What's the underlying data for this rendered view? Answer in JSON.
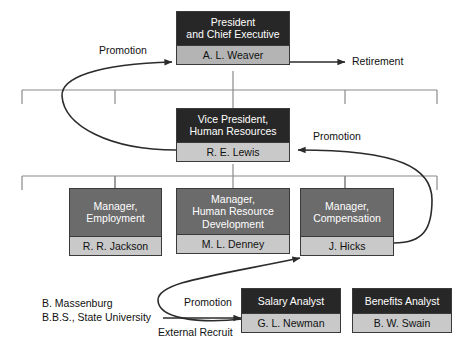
{
  "diagram": {
    "colors": {
      "title_dark": "#272727",
      "title_mid": "#6b6b6b",
      "name_light": "#c9c9c9",
      "name_mid": "#b4b4b4",
      "line": "#2b2b2b",
      "connector": "#8a8a8a",
      "text_dark": "#111111",
      "text_light": "#ffffff",
      "background": "#ffffff"
    }
  },
  "nodes": [
    {
      "id": "president",
      "title": "President\nand Chief Executive",
      "title_line1": "President",
      "title_line2": "and Chief Executive",
      "name": "A. L. Weaver",
      "level": 1
    },
    {
      "id": "vice-president-hr",
      "title": "Vice President,\nHuman Resources",
      "title_line1": "Vice President,",
      "title_line2": "Human Resources",
      "name": "R. E. Lewis",
      "level": 2
    },
    {
      "id": "manager-employment",
      "title": "Manager,\nEmployment",
      "title_line1": "Manager,",
      "title_line2": "Employment",
      "name": "R. R. Jackson",
      "level": 3
    },
    {
      "id": "manager-human-resource-development",
      "title": "Manager,\nHuman Resource\nDevelopment",
      "title_line1": "Manager,",
      "title_line2": "Human Resource",
      "title_line3": "Development",
      "name": "M. L. Denney",
      "level": 3
    },
    {
      "id": "manager-compensation",
      "title": "Manager,\nCompensation",
      "title_line1": "Manager,",
      "title_line2": "Compensation",
      "name": "J. Hicks",
      "level": 3
    },
    {
      "id": "salary-analyst",
      "title": "Salary Analyst",
      "title_line1": "Salary Analyst",
      "name": "G. L. Newman",
      "level": 4
    },
    {
      "id": "benefits-analyst",
      "title": "Benefits Analyst",
      "title_line1": "Benefits Analyst",
      "name": "B. W. Swain",
      "level": 4
    }
  ],
  "edge_labels": {
    "promotion_to_president": "Promotion",
    "retirement": "Retirement",
    "promotion_to_vp": "Promotion",
    "promotion_to_manager": "Promotion",
    "external_recruit": "External Recruit"
  },
  "external_candidate": {
    "name": "B. Massenburg",
    "credential": "B.B.S., State University"
  }
}
